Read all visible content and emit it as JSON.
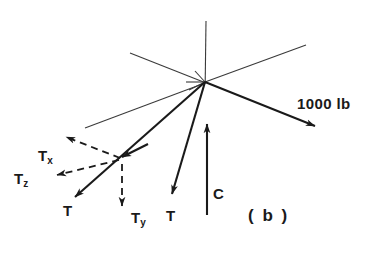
{
  "figure": {
    "caption": "( b )",
    "background_color": "#ffffff",
    "ink_color": "#1a1a1a",
    "width": 379,
    "height": 260
  },
  "labels": {
    "force_1000lb": "1000 lb",
    "tension_T_left": "T",
    "tension_T_middle": "T",
    "compression_C": "C",
    "component_Tx_base": "T",
    "component_Tx_sub": "x",
    "component_Ty_base": "T",
    "component_Ty_sub": "y",
    "component_Tz_base": "T",
    "component_Tz_sub": "z"
  },
  "geometry": {
    "node": {
      "x": 205,
      "y": 82
    },
    "axes": [
      {
        "name": "vertical-axis-up",
        "x1": 206,
        "y1": 21,
        "x2": 205,
        "y2": 82
      },
      {
        "name": "axis-upper-left",
        "x1": 130,
        "y1": 53,
        "x2": 205,
        "y2": 82
      },
      {
        "name": "axis-upper-right",
        "x1": 205,
        "y1": 82,
        "x2": 306,
        "y2": 45
      },
      {
        "name": "axis-lower-left",
        "x1": 205,
        "y1": 82,
        "x2": 85,
        "y2": 128
      },
      {
        "name": "axis-stub-short",
        "x1": 205,
        "y1": 82,
        "x2": 196,
        "y2": 72
      }
    ],
    "vectors": [
      {
        "name": "force-1000lb",
        "x1": 205,
        "y1": 82,
        "x2": 318,
        "y2": 127,
        "style": "solid-bold"
      },
      {
        "name": "tension-left",
        "x1": 205,
        "y1": 82,
        "x2": 72,
        "y2": 200,
        "style": "solid-bold"
      },
      {
        "name": "tension-middle",
        "x1": 205,
        "y1": 82,
        "x2": 172,
        "y2": 198,
        "style": "solid-bold"
      },
      {
        "name": "compression-C",
        "x1": 207,
        "y1": 215,
        "x2": 207,
        "y2": 120,
        "style": "solid-bold"
      },
      {
        "name": "component-Tx",
        "x1": 120,
        "y1": 158,
        "x2": 62,
        "y2": 136,
        "style": "dashed"
      },
      {
        "name": "component-Tz",
        "x1": 120,
        "y1": 160,
        "x2": 52,
        "y2": 176,
        "style": "dashed"
      },
      {
        "name": "component-Ty",
        "x1": 122,
        "y1": 165,
        "x2": 122,
        "y2": 211,
        "style": "dashed"
      },
      {
        "name": "tension-left-midpoint-arrow",
        "x1": 145,
        "y1": 146,
        "x2": 118,
        "y2": 159,
        "style": "solid-bold"
      }
    ]
  }
}
